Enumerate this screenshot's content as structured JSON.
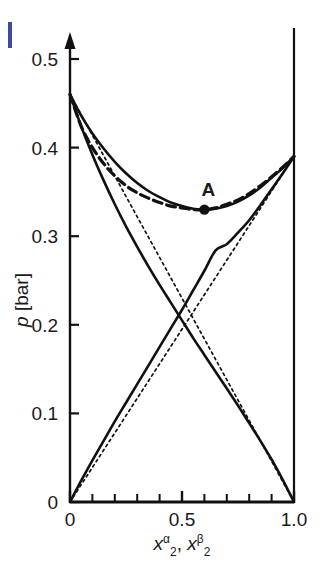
{
  "figure": {
    "name": "pressure-composition-diagram",
    "background": "#ffffff",
    "line_color": "#111111",
    "accent_color": "#3b4a9c"
  },
  "chart_data": {
    "type": "line",
    "title": "",
    "xlabel": "x2alpha, x2beta",
    "xlabel_parts": {
      "base1": "x",
      "sub1": "2",
      "sup1": "α",
      "sep": ", ",
      "base2": "x",
      "sub2": "2",
      "sup2": "β"
    },
    "ylabel": "p [bar]",
    "xlim": [
      0,
      1.0
    ],
    "ylim": [
      0,
      0.52
    ],
    "grid": false,
    "legend": "none",
    "xticks": [
      0,
      0.5,
      1.0
    ],
    "xticklabels": [
      "0",
      "0.5",
      "1.0"
    ],
    "xminorticks": [
      0.1,
      0.2,
      0.3,
      0.4,
      0.6,
      0.7,
      0.8,
      0.9
    ],
    "yticks": [
      0,
      0.1,
      0.2,
      0.3,
      0.4,
      0.5
    ],
    "yticklabels": [
      "0",
      "0.1",
      "0.2",
      "0.3",
      "0.4",
      "0.5"
    ],
    "annotations": [
      {
        "label": "A",
        "x": 0.6,
        "y": 0.33,
        "marker": "filled-circle"
      }
    ],
    "series": [
      {
        "name": "total-pressure-solid",
        "style": "solid",
        "width": 2.6,
        "points": [
          [
            0.0,
            0.46
          ],
          [
            0.05,
            0.436
          ],
          [
            0.1,
            0.416
          ],
          [
            0.15,
            0.399
          ],
          [
            0.2,
            0.384
          ],
          [
            0.25,
            0.371
          ],
          [
            0.3,
            0.36
          ],
          [
            0.35,
            0.351
          ],
          [
            0.4,
            0.344
          ],
          [
            0.45,
            0.338
          ],
          [
            0.5,
            0.334
          ],
          [
            0.55,
            0.331
          ],
          [
            0.6,
            0.33
          ],
          [
            0.65,
            0.331
          ],
          [
            0.7,
            0.334
          ],
          [
            0.75,
            0.339
          ],
          [
            0.8,
            0.346
          ],
          [
            0.85,
            0.355
          ],
          [
            0.9,
            0.366
          ],
          [
            0.95,
            0.377
          ],
          [
            1.0,
            0.39
          ]
        ]
      },
      {
        "name": "dew-curve-dashed",
        "style": "dashed",
        "width": 3.2,
        "points": [
          [
            0.0,
            0.46
          ],
          [
            0.05,
            0.424
          ],
          [
            0.1,
            0.4
          ],
          [
            0.15,
            0.382
          ],
          [
            0.2,
            0.368
          ],
          [
            0.25,
            0.357
          ],
          [
            0.3,
            0.349
          ],
          [
            0.35,
            0.343
          ],
          [
            0.4,
            0.338
          ],
          [
            0.45,
            0.334
          ],
          [
            0.5,
            0.332
          ],
          [
            0.55,
            0.33
          ],
          [
            0.6,
            0.33
          ],
          [
            0.65,
            0.332
          ],
          [
            0.7,
            0.336
          ],
          [
            0.75,
            0.341
          ],
          [
            0.8,
            0.348
          ],
          [
            0.85,
            0.357
          ],
          [
            0.9,
            0.367
          ],
          [
            0.95,
            0.378
          ],
          [
            1.0,
            0.39
          ]
        ]
      },
      {
        "name": "partial-pressure-component1-solid",
        "style": "solid",
        "width": 2.6,
        "points": [
          [
            0.0,
            0.46
          ],
          [
            0.05,
            0.424
          ],
          [
            0.1,
            0.392
          ],
          [
            0.15,
            0.363
          ],
          [
            0.2,
            0.336
          ],
          [
            0.25,
            0.311
          ],
          [
            0.3,
            0.288
          ],
          [
            0.35,
            0.266
          ],
          [
            0.4,
            0.245
          ],
          [
            0.45,
            0.225
          ],
          [
            0.5,
            0.205
          ],
          [
            0.55,
            0.185
          ],
          [
            0.6,
            0.166
          ],
          [
            0.65,
            0.147
          ],
          [
            0.7,
            0.128
          ],
          [
            0.75,
            0.109
          ],
          [
            0.8,
            0.089
          ],
          [
            0.85,
            0.069
          ],
          [
            0.9,
            0.048
          ],
          [
            0.95,
            0.025
          ],
          [
            1.0,
            0.0
          ]
        ]
      },
      {
        "name": "partial-pressure-component2-solid",
        "style": "solid",
        "width": 2.6,
        "points": [
          [
            0.0,
            0.0
          ],
          [
            0.05,
            0.024
          ],
          [
            0.1,
            0.047
          ],
          [
            0.15,
            0.069
          ],
          [
            0.2,
            0.091
          ],
          [
            0.25,
            0.112
          ],
          [
            0.3,
            0.133
          ],
          [
            0.35,
            0.154
          ],
          [
            0.4,
            0.175
          ],
          [
            0.45,
            0.196
          ],
          [
            0.5,
            0.217
          ],
          [
            0.55,
            0.239
          ],
          [
            0.6,
            0.261
          ],
          [
            0.65,
            0.284
          ],
          [
            0.7,
            0.291
          ],
          [
            0.75,
            0.304
          ],
          [
            0.8,
            0.318
          ],
          [
            0.85,
            0.335
          ],
          [
            0.9,
            0.353
          ],
          [
            0.95,
            0.371
          ],
          [
            1.0,
            0.39
          ]
        ]
      },
      {
        "name": "raoult-line-component1-dotted",
        "style": "dotted",
        "width": 1.7,
        "points": [
          [
            0.0,
            0.46
          ],
          [
            1.0,
            0.0
          ]
        ]
      },
      {
        "name": "raoult-line-component2-dotted",
        "style": "dotted",
        "width": 1.7,
        "points": [
          [
            0.0,
            0.0
          ],
          [
            1.0,
            0.39
          ]
        ]
      }
    ]
  },
  "axis": {
    "y_arrow": true,
    "right_border_line": true,
    "ylabel_text": "p [bar]"
  }
}
